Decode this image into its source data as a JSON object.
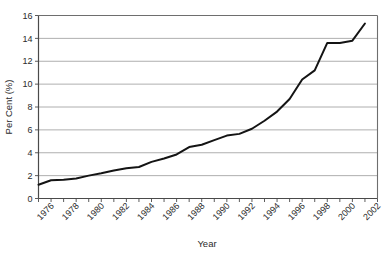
{
  "chart_data": {
    "type": "line",
    "title": "",
    "xlabel": "Year",
    "ylabel": "Per Cent (%)",
    "xlim": [
      1975,
      2002
    ],
    "ylim": [
      0,
      16
    ],
    "ytick_step": 2,
    "grid": "horizontal",
    "legend": "none",
    "yticks": [
      "0",
      "2",
      "4",
      "6",
      "8",
      "10",
      "12",
      "14",
      "16"
    ],
    "ytick_values": [
      0,
      2,
      4,
      6,
      8,
      10,
      12,
      14,
      16
    ],
    "xticks": [
      "1976",
      "1978",
      "1980",
      "1982",
      "1984",
      "1986",
      "1988",
      "1990",
      "1992",
      "1994",
      "1996",
      "1998",
      "2000",
      "2002"
    ],
    "xtick_values": [
      1976,
      1978,
      1980,
      1982,
      1984,
      1986,
      1988,
      1990,
      1992,
      1994,
      1996,
      1998,
      2000,
      2002
    ],
    "xtick_rotation": 45,
    "minor_xticks_every": 1,
    "series": [
      {
        "name": "Per Cent",
        "color": "#141414",
        "x": [
          1975,
          1976,
          1977,
          1978,
          1979,
          1980,
          1981,
          1982,
          1983,
          1984,
          1985,
          1986,
          1987,
          1988,
          1989,
          1990,
          1991,
          1992,
          1993,
          1994,
          1995,
          1996,
          1997,
          1998,
          1999,
          2000,
          2001
        ],
        "values": [
          1.2,
          1.6,
          1.65,
          1.75,
          2.0,
          2.2,
          2.45,
          2.65,
          2.75,
          3.2,
          3.5,
          3.85,
          4.5,
          4.7,
          5.1,
          5.5,
          5.65,
          6.1,
          6.8,
          7.6,
          8.7,
          10.4,
          11.2,
          13.6,
          13.6,
          13.8,
          15.3
        ]
      }
    ],
    "colors": {
      "line": "#141414",
      "grid": "#9a9a9a",
      "axis": "#4a4a4a",
      "text": "#2b2b2b",
      "background": "#ffffff"
    }
  }
}
